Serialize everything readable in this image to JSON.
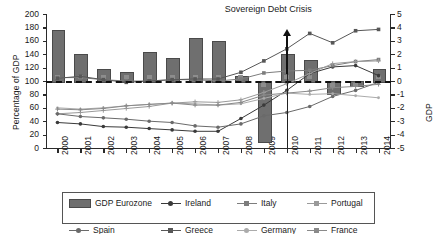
{
  "chart_data": {
    "type": "bar",
    "title": "",
    "ylabel": "Percentage of GDP",
    "ylabel_right": "GDP",
    "xlabel": "",
    "ylim": [
      0,
      200
    ],
    "ylim_right": [
      -5,
      5
    ],
    "grid": false,
    "legend_position": "bottom",
    "categories": [
      "2000",
      "2001",
      "2002",
      "2003",
      "2004",
      "2005",
      "2006",
      "2007",
      "2008",
      "2009",
      "2010",
      "2011",
      "2012",
      "2013",
      "2014"
    ],
    "yticks": [
      "200",
      "180",
      "160",
      "140",
      "120",
      "100",
      "80",
      "60",
      "40",
      "20",
      "0"
    ],
    "yticks_right": [
      "5",
      "4",
      "3",
      "2",
      "1",
      "0",
      "-1",
      "-2",
      "-3",
      "-4",
      "-5"
    ],
    "annotations": [
      {
        "text": "Sovereign Debt Crisis",
        "x": "2010",
        "note": "upward arrow marking crisis onset"
      }
    ],
    "bar_series": {
      "name": "GDP Eurozone",
      "axis": "right",
      "unit": "percent GDP growth",
      "values": [
        3.8,
        2.0,
        0.9,
        0.7,
        2.2,
        1.7,
        3.2,
        3.0,
        0.4,
        -4.5,
        2.0,
        1.6,
        -0.9,
        -0.3,
        0.9
      ]
    },
    "series": [
      {
        "name": "Ireland",
        "axis": "left",
        "values": [
          38,
          36,
          32,
          31,
          29,
          27,
          25,
          25,
          44,
          64,
          86,
          111,
          121,
          123,
          108
        ]
      },
      {
        "name": "Italy",
        "axis": "left",
        "values": [
          105,
          105,
          102,
          100,
          100,
          102,
          102,
          100,
          103,
          112,
          115,
          116,
          123,
          129,
          132
        ]
      },
      {
        "name": "Portugal",
        "axis": "left",
        "values": [
          51,
          53,
          56,
          59,
          62,
          67,
          69,
          68,
          72,
          83,
          96,
          111,
          126,
          129,
          130
        ]
      },
      {
        "name": "Spain",
        "axis": "left",
        "values": [
          51,
          47,
          45,
          43,
          40,
          38,
          33,
          31,
          36,
          48,
          53,
          62,
          77,
          86,
          98
        ]
      },
      {
        "name": "Greece",
        "axis": "left",
        "values": [
          104,
          107,
          102,
          98,
          100,
          102,
          103,
          103,
          113,
          130,
          148,
          171,
          157,
          175,
          177
        ]
      },
      {
        "name": "Germany",
        "axis": "left",
        "values": [
          60,
          58,
          60,
          63,
          65,
          67,
          66,
          64,
          66,
          74,
          82,
          80,
          81,
          78,
          75
        ]
      },
      {
        "name": "France",
        "axis": "left",
        "values": [
          58,
          57,
          59,
          63,
          65,
          67,
          64,
          64,
          68,
          79,
          82,
          85,
          90,
          92,
          95
        ]
      }
    ]
  },
  "axis": {
    "left_title": "Percentage of GDP",
    "right_title": "GDP"
  },
  "annotation": {
    "crisis_label": "Sovereign Debt Crisis"
  },
  "legend": {
    "items": [
      {
        "label": "GDP Eurozone",
        "marker": "bar",
        "color": "#6f6f6f"
      },
      {
        "label": "Ireland",
        "marker": "circle",
        "color": "#3a3a3a"
      },
      {
        "label": "Italy",
        "marker": "square",
        "color": "#7d7d7d"
      },
      {
        "label": "Portugal",
        "marker": "cross",
        "color": "#9a9a9a"
      },
      {
        "label": "Spain",
        "marker": "circle",
        "color": "#6a6a6a"
      },
      {
        "label": "Greece",
        "marker": "square",
        "color": "#575757"
      },
      {
        "label": "Germany",
        "marker": "dot",
        "color": "#ababab"
      },
      {
        "label": "France",
        "marker": "plus",
        "color": "#8a8a8a"
      }
    ]
  }
}
